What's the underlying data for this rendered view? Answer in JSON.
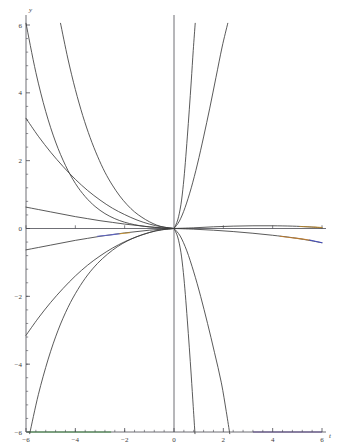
{
  "figure": {
    "kind": "mathematica-plot",
    "background_color": "#ffffff",
    "axis_color": "#4a4a52",
    "curve_color": "#3c3c3c",
    "width": 338,
    "height": 448
  },
  "chart_data": {
    "type": "line",
    "title": "",
    "subtitle": "",
    "xlabel": "t",
    "ylabel": "y",
    "xlim": [
      -6,
      6
    ],
    "ylim": [
      -6,
      6
    ],
    "grid": false,
    "legend": null,
    "axes_style": "crossed-at-origin",
    "xticks": [
      -6,
      -4,
      -2,
      0,
      2,
      4,
      6
    ],
    "xticklabels": [
      "-6",
      "-4",
      "-2",
      "0",
      "2",
      "4",
      "6"
    ],
    "yticks": [
      -6,
      -4,
      -2,
      0,
      2,
      4,
      6
    ],
    "yticklabels": [
      "-6",
      "-4",
      "-2",
      "0",
      "2",
      "4",
      "6"
    ],
    "minor_tick_subdivisions": 5,
    "series": [
      {
        "name": "curve-1",
        "color": "#3c3c3c",
        "points": [
          [
            -6,
            6.05
          ],
          [
            -5.6,
            4.6
          ],
          [
            -5.2,
            3.45
          ],
          [
            -4.8,
            2.55
          ],
          [
            -4.4,
            1.86
          ],
          [
            -4.0,
            1.33
          ],
          [
            -3.6,
            0.94
          ],
          [
            -3.2,
            0.65
          ],
          [
            -2.8,
            0.44
          ],
          [
            -2.4,
            0.29
          ],
          [
            -2.0,
            0.185
          ],
          [
            -1.6,
            0.112
          ],
          [
            -1.2,
            0.063
          ],
          [
            -0.8,
            0.031
          ],
          [
            -0.4,
            0.011
          ],
          [
            0,
            0
          ]
        ]
      },
      {
        "name": "curve-2",
        "color": "#3c3c3c",
        "points": [
          [
            -4.6,
            6.05
          ],
          [
            -4.3,
            5.0
          ],
          [
            -4.0,
            4.1
          ],
          [
            -3.7,
            3.33
          ],
          [
            -3.4,
            2.68
          ],
          [
            -3.1,
            2.13
          ],
          [
            -2.8,
            1.66
          ],
          [
            -2.5,
            1.28
          ],
          [
            -2.2,
            0.96
          ],
          [
            -1.9,
            0.7
          ],
          [
            -1.6,
            0.49
          ],
          [
            -1.3,
            0.33
          ],
          [
            -1.0,
            0.2
          ],
          [
            -0.7,
            0.1
          ],
          [
            -0.4,
            0.04
          ],
          [
            0,
            0
          ]
        ]
      },
      {
        "name": "curve-3",
        "color": "#3c3c3c",
        "points": [
          [
            -6,
            3.25
          ],
          [
            -5.5,
            2.72
          ],
          [
            -5.0,
            2.25
          ],
          [
            -4.5,
            1.83
          ],
          [
            -4.0,
            1.45
          ],
          [
            -3.5,
            1.12
          ],
          [
            -3.0,
            0.84
          ],
          [
            -2.5,
            0.6
          ],
          [
            -2.0,
            0.41
          ],
          [
            -1.5,
            0.25
          ],
          [
            -1.0,
            0.13
          ],
          [
            -0.5,
            0.05
          ],
          [
            0,
            0
          ]
        ]
      },
      {
        "name": "curve-4",
        "color": "#3c3c3c",
        "points": [
          [
            -6,
            0.63
          ],
          [
            -5.5,
            0.56
          ],
          [
            -5.0,
            0.49
          ],
          [
            -4.5,
            0.42
          ],
          [
            -4.0,
            0.35
          ],
          [
            -3.5,
            0.29
          ],
          [
            -3.0,
            0.23
          ],
          [
            -2.5,
            0.18
          ],
          [
            -2.0,
            0.13
          ],
          [
            -1.5,
            0.09
          ],
          [
            -1.0,
            0.05
          ],
          [
            -0.5,
            0.02
          ],
          [
            0,
            0
          ]
        ]
      },
      {
        "name": "curve-5",
        "color": "#3c3c3c",
        "points": [
          [
            -6,
            -0.63
          ],
          [
            -5.5,
            -0.56
          ],
          [
            -5.0,
            -0.49
          ],
          [
            -4.5,
            -0.42
          ],
          [
            -4.0,
            -0.35
          ],
          [
            -3.5,
            -0.29
          ],
          [
            -3.0,
            -0.23
          ],
          [
            -2.5,
            -0.18
          ],
          [
            -2.0,
            -0.13
          ],
          [
            -1.5,
            -0.09
          ],
          [
            -1.0,
            -0.05
          ],
          [
            -0.5,
            -0.02
          ],
          [
            0,
            0
          ]
        ]
      },
      {
        "name": "curve-6",
        "color": "#3c3c3c",
        "points": [
          [
            -6,
            -3.15
          ],
          [
            -5.5,
            -2.64
          ],
          [
            -5.0,
            -2.18
          ],
          [
            -4.5,
            -1.77
          ],
          [
            -4.0,
            -1.4
          ],
          [
            -3.5,
            -1.08
          ],
          [
            -3.0,
            -0.81
          ],
          [
            -2.5,
            -0.58
          ],
          [
            -2.0,
            -0.39
          ],
          [
            -1.5,
            -0.24
          ],
          [
            -1.0,
            -0.12
          ],
          [
            -0.5,
            -0.04
          ],
          [
            0,
            0
          ]
        ]
      },
      {
        "name": "curve-7",
        "color": "#3c3c3c",
        "points": [
          [
            -5.85,
            -6.05
          ],
          [
            -5.5,
            -4.9
          ],
          [
            -5.1,
            -3.85
          ],
          [
            -4.7,
            -3.0
          ],
          [
            -4.3,
            -2.33
          ],
          [
            -3.9,
            -1.8
          ],
          [
            -3.5,
            -1.37
          ],
          [
            -3.1,
            -1.03
          ],
          [
            -2.7,
            -0.76
          ],
          [
            -2.3,
            -0.54
          ],
          [
            -1.9,
            -0.37
          ],
          [
            -1.5,
            -0.24
          ],
          [
            -1.1,
            -0.14
          ],
          [
            -0.7,
            -0.06
          ],
          [
            -0.3,
            -0.02
          ],
          [
            0,
            0
          ]
        ]
      },
      {
        "name": "curve-8",
        "color": "#3c3c3c",
        "points": [
          [
            0,
            0
          ],
          [
            0.15,
            0.25
          ],
          [
            0.28,
            0.7
          ],
          [
            0.38,
            1.3
          ],
          [
            0.46,
            1.95
          ],
          [
            0.54,
            2.7
          ],
          [
            0.62,
            3.5
          ],
          [
            0.7,
            4.35
          ],
          [
            0.78,
            5.25
          ],
          [
            0.86,
            6.05
          ]
        ]
      },
      {
        "name": "curve-9",
        "color": "#3c3c3c",
        "points": [
          [
            0,
            0
          ],
          [
            0.22,
            0.22
          ],
          [
            0.45,
            0.62
          ],
          [
            0.7,
            1.2
          ],
          [
            0.95,
            1.9
          ],
          [
            1.2,
            2.7
          ],
          [
            1.45,
            3.55
          ],
          [
            1.7,
            4.45
          ],
          [
            1.95,
            5.35
          ],
          [
            2.18,
            6.05
          ]
        ]
      },
      {
        "name": "curve-10",
        "color": "#3c3c3c",
        "points": [
          [
            0,
            0
          ],
          [
            0.15,
            -0.25
          ],
          [
            0.28,
            -0.7
          ],
          [
            0.38,
            -1.3
          ],
          [
            0.46,
            -1.95
          ],
          [
            0.54,
            -2.7
          ],
          [
            0.62,
            -3.5
          ],
          [
            0.7,
            -4.35
          ],
          [
            0.78,
            -5.25
          ],
          [
            0.85,
            -6.05
          ]
        ]
      },
      {
        "name": "curve-11",
        "color": "#3c3c3c",
        "points": [
          [
            0,
            0
          ],
          [
            0.25,
            -0.22
          ],
          [
            0.52,
            -0.66
          ],
          [
            0.8,
            -1.28
          ],
          [
            1.08,
            -2.0
          ],
          [
            1.36,
            -2.8
          ],
          [
            1.64,
            -3.65
          ],
          [
            1.92,
            -4.55
          ],
          [
            2.12,
            -5.4
          ],
          [
            2.26,
            -6.05
          ]
        ]
      },
      {
        "name": "curve-12-flat-upper-right",
        "color": "#3c3c3c",
        "points": [
          [
            0,
            0
          ],
          [
            0.8,
            0.02
          ],
          [
            1.6,
            0.05
          ],
          [
            2.4,
            0.07
          ],
          [
            3.2,
            0.08
          ],
          [
            4.0,
            0.08
          ],
          [
            4.8,
            0.07
          ],
          [
            5.4,
            0.05
          ],
          [
            6,
            0.02
          ]
        ]
      },
      {
        "name": "curve-13-flat-lower-right",
        "color": "#3c3c3c",
        "points": [
          [
            0,
            0
          ],
          [
            0.8,
            -0.02
          ],
          [
            1.6,
            -0.05
          ],
          [
            2.4,
            -0.09
          ],
          [
            3.2,
            -0.14
          ],
          [
            4.0,
            -0.2
          ],
          [
            4.8,
            -0.27
          ],
          [
            5.4,
            -0.34
          ],
          [
            6,
            -0.42
          ]
        ]
      },
      {
        "name": "tinted-curve-left",
        "color": "#5b62c8",
        "points": [
          [
            -3.1,
            -0.23
          ],
          [
            -2.6,
            -0.19
          ],
          [
            -2.2,
            -0.155
          ]
        ]
      },
      {
        "name": "tinted-curve-left-warm",
        "color": "#c8922e",
        "points": [
          [
            -2.2,
            -0.155
          ],
          [
            -1.8,
            -0.125
          ]
        ]
      },
      {
        "name": "tinted-curve-right-warm",
        "color": "#c07b2a",
        "points": [
          [
            4.3,
            -0.23
          ],
          [
            5.0,
            -0.29
          ],
          [
            5.5,
            -0.34
          ]
        ]
      },
      {
        "name": "tinted-curve-right-cool",
        "color": "#3f49c2",
        "points": [
          [
            5.5,
            -0.34
          ],
          [
            6.0,
            -0.42
          ]
        ]
      },
      {
        "name": "tinted-curve-right-upper",
        "color": "#b8862c",
        "points": [
          [
            5.1,
            0.06
          ],
          [
            5.6,
            0.045
          ],
          [
            6.0,
            0.03
          ]
        ]
      }
    ],
    "axis_segments": [
      {
        "name": "green-x-axis-segment",
        "color": "#66c46a",
        "axis": "x",
        "from": -5.95,
        "to": -2.55,
        "y": 0
      },
      {
        "name": "violet-x-axis-segment",
        "color": "#8a6fbf",
        "axis": "x",
        "from": 3.2,
        "to": 6.0,
        "y": 0
      }
    ]
  }
}
